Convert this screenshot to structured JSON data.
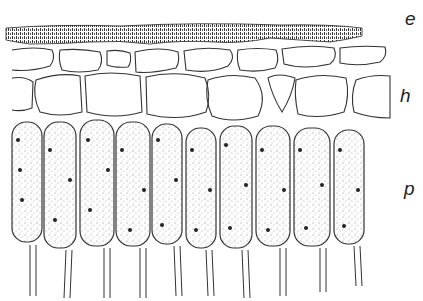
{
  "figure": {
    "labels": {
      "e": "e",
      "h": "h",
      "p": "p"
    },
    "layers": [
      {
        "key": "e",
        "label": "e"
      },
      {
        "key": "h",
        "label": "h"
      },
      {
        "key": "p",
        "label": "p"
      }
    ],
    "colors": {
      "ink": "#222222",
      "background": "#ffffff"
    }
  }
}
